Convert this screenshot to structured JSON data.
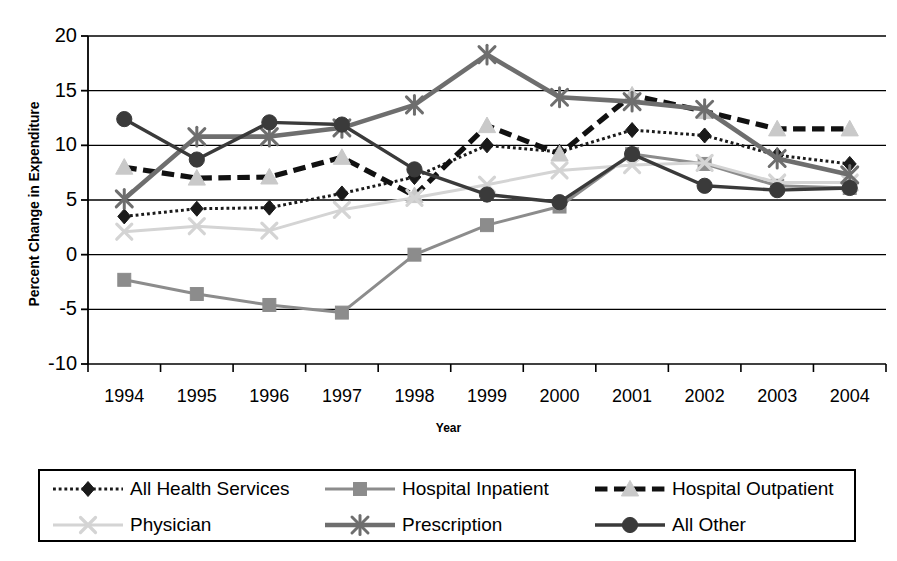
{
  "chart_data": {
    "type": "line",
    "title": "",
    "xlabel": "Year",
    "ylabel": "Percent Change in Expenditure",
    "categories": [
      "1994",
      "1995",
      "1996",
      "1997",
      "1998",
      "1999",
      "2000",
      "2001",
      "2002",
      "2003",
      "2004"
    ],
    "x": [
      1994,
      1995,
      1996,
      1997,
      1998,
      1999,
      2000,
      2001,
      2002,
      2003,
      2004
    ],
    "ylim": [
      -10,
      20
    ],
    "yticks": [
      -10,
      -5,
      0,
      5,
      10,
      15,
      20
    ],
    "ytick_labels": [
      "-10",
      "-5",
      "0",
      "5",
      "10",
      "15",
      "20"
    ],
    "grid": true,
    "legend_position": "bottom",
    "series": [
      {
        "name": "All Health Services",
        "marker": "diamond",
        "line_style": "dotted",
        "color": "#1a1a1a",
        "marker_color": "#1a1a1a",
        "values": [
          3.5,
          4.2,
          4.3,
          5.6,
          7.1,
          10.0,
          9.4,
          11.4,
          10.9,
          9.1,
          8.3
        ]
      },
      {
        "name": "Hospital Inpatient",
        "marker": "square",
        "line_style": "solid",
        "color": "#8c8c8c",
        "marker_color": "#8c8c8c",
        "values": [
          -2.3,
          -3.6,
          -4.6,
          -5.3,
          0.0,
          2.7,
          4.4,
          9.2,
          8.3,
          6.3,
          6.1
        ]
      },
      {
        "name": "Hospital Outpatient",
        "marker": "triangle",
        "line_style": "dashed",
        "color": "#111111",
        "marker_color": "#c9c9c9",
        "values": [
          8.0,
          7.0,
          7.1,
          8.9,
          5.4,
          11.8,
          9.2,
          14.6,
          13.1,
          11.5,
          11.5
        ]
      },
      {
        "name": "Physician",
        "marker": "x",
        "line_style": "solid",
        "color": "#d4d4d4",
        "marker_color": "#d4d4d4",
        "values": [
          2.1,
          2.6,
          2.2,
          4.1,
          5.2,
          6.4,
          7.7,
          8.2,
          8.4,
          6.6,
          6.6
        ]
      },
      {
        "name": "Prescription",
        "marker": "asterisk",
        "line_style": "solid",
        "color": "#6e6e6e",
        "marker_color": "#6e6e6e",
        "values": [
          5.1,
          10.8,
          10.8,
          11.6,
          13.7,
          18.3,
          14.4,
          14.0,
          13.3,
          8.8,
          7.3
        ]
      },
      {
        "name": "All Other",
        "marker": "circle",
        "line_style": "solid",
        "color": "#3a3a3a",
        "marker_color": "#3a3a3a",
        "values": [
          12.4,
          8.7,
          12.1,
          11.9,
          7.8,
          5.5,
          4.8,
          9.2,
          6.3,
          5.9,
          6.1
        ]
      }
    ]
  },
  "legend": {
    "rows": [
      [
        {
          "label": "All Health Services",
          "series_index": 0
        },
        {
          "label": "Hospital Inpatient",
          "series_index": 1
        },
        {
          "label": "Hospital Outpatient",
          "series_index": 2
        }
      ],
      [
        {
          "label": "Physician",
          "series_index": 3
        },
        {
          "label": "Prescription",
          "series_index": 4
        },
        {
          "label": "All Other",
          "series_index": 5
        }
      ]
    ]
  }
}
